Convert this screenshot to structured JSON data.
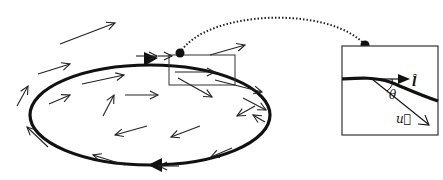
{
  "diagram": {
    "colors": {
      "ink": "#111111",
      "background": "#ffffff"
    },
    "loop": {
      "direction": "clockwise",
      "arrowheads": 2
    },
    "inset": {
      "labels": {
        "tangent": "l̂",
        "field": "u⃗",
        "angle": "θ"
      },
      "connector_style": "dotted"
    },
    "field_arrow_count": 22
  }
}
